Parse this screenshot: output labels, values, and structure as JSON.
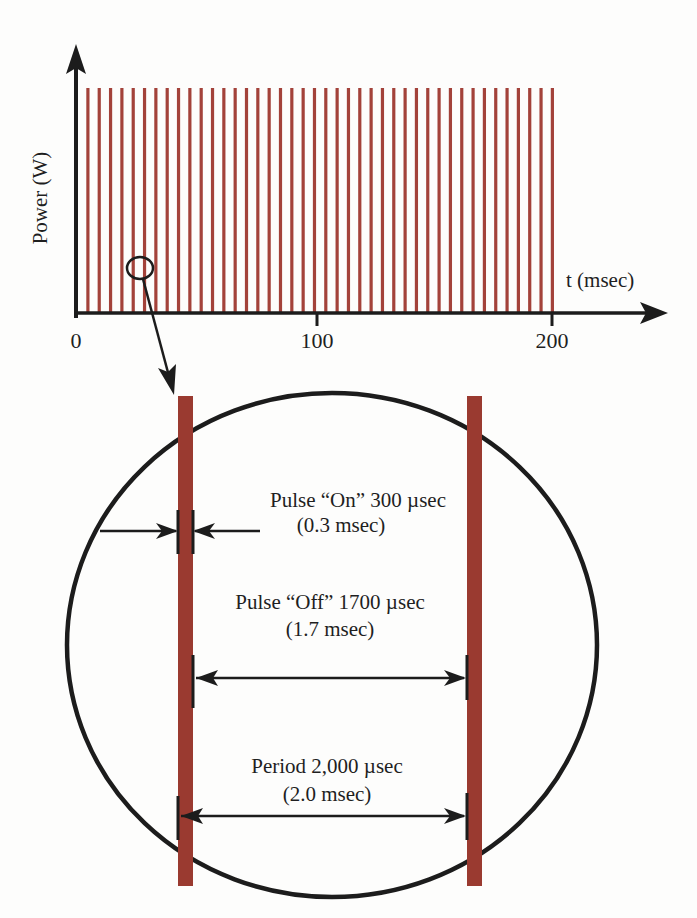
{
  "colors": {
    "pulse": "#9a3a30",
    "pulse_thin": "#a3423a",
    "ink": "#1c1c1c",
    "background": "#fdfdfc"
  },
  "chart_data": {
    "type": "bar",
    "title": "",
    "xlabel": "t (msec)",
    "ylabel": "Power (W)",
    "xlim": [
      0,
      200
    ],
    "x_ticks": [
      0,
      100,
      200
    ],
    "x_tick_labels": [
      "0",
      "100",
      "200"
    ],
    "pulse_count": 42,
    "pulse_period_msec": 4.76,
    "pulse_first_x_msec": 5,
    "pulse_amplitude": 1,
    "grid": false
  },
  "inset": {
    "label_on_line1": "Pulse “On” 300 µsec",
    "label_on_line2": "(0.3 msec)",
    "label_off_line1": "Pulse “Off” 1700 µsec",
    "label_off_line2": "(1.7 msec)",
    "label_period_line1": "Period 2,000 µsec",
    "label_period_line2": "(2.0 msec)",
    "pulse_on_usec": 300,
    "pulse_off_usec": 1700,
    "period_usec": 2000
  }
}
